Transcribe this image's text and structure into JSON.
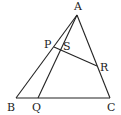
{
  "diagram": {
    "points": {
      "A": {
        "label": "A",
        "x": 77,
        "y": 15,
        "lx": 78,
        "ly": 10
      },
      "B": {
        "label": "B",
        "x": 16,
        "y": 98,
        "lx": 12,
        "ly": 110
      },
      "C": {
        "label": "C",
        "x": 110,
        "y": 98,
        "lx": 110,
        "ly": 110
      },
      "Q": {
        "label": "Q",
        "x": 38,
        "y": 98,
        "lx": 36,
        "ly": 110
      },
      "P": {
        "label": "P",
        "x": 54,
        "y": 47,
        "lx": 44,
        "ly": 46
      },
      "S": {
        "label": "S",
        "x": 62,
        "y": 49,
        "lx": 62,
        "ly": 48
      },
      "R": {
        "label": "R",
        "x": 97,
        "y": 66,
        "lx": 100,
        "ly": 70
      }
    },
    "segments": [
      "AB",
      "AC",
      "BC",
      "AQ",
      "PR"
    ]
  }
}
